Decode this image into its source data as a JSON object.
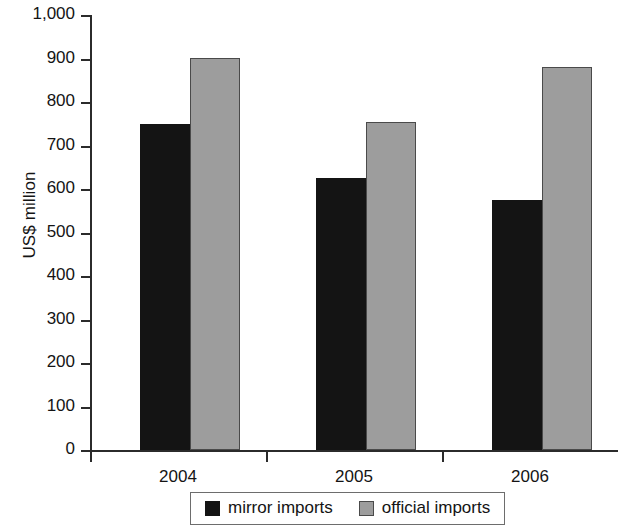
{
  "chart_data": {
    "type": "bar",
    "title": "",
    "subtitle": "",
    "xlabel": "",
    "ylabel": "US$ million",
    "categories": [
      "2004",
      "2005",
      "2006"
    ],
    "series": [
      {
        "name": "mirror imports",
        "color": "#141414",
        "values": [
          750,
          625,
          575
        ]
      },
      {
        "name": "official imports",
        "color": "#9d9d9d",
        "values": [
          900,
          755,
          880
        ]
      }
    ],
    "ylim": [
      0,
      1000
    ],
    "yticks": [
      0,
      100,
      200,
      300,
      400,
      500,
      600,
      700,
      800,
      900,
      1000
    ],
    "ytick_labels": [
      "0",
      "100",
      "200",
      "300",
      "400",
      "500",
      "600",
      "700",
      "800",
      "900",
      "1,000"
    ],
    "grid": false,
    "legend_position": "bottom"
  },
  "legend": {
    "entries": [
      {
        "label": "mirror imports",
        "swatch": "mirror-swatch-icon"
      },
      {
        "label": "official imports",
        "swatch": "official-swatch-icon"
      }
    ]
  }
}
